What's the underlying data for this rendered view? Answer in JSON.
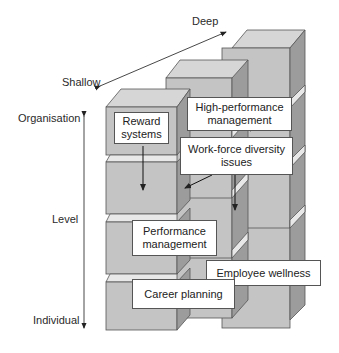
{
  "axes": {
    "depth": {
      "deep_label": "Deep",
      "shallow_label": "Shallow"
    },
    "level": {
      "top_label": "Organisation",
      "middle_label": "Level",
      "bottom_label": "Individual"
    }
  },
  "boxes": {
    "reward_systems": "Reward systems",
    "high_performance": "High-performance management",
    "workforce_diversity": "Work-force diversity issues",
    "performance_management": "Performance management",
    "employee_wellness": "Employee wellness",
    "career_planning": "Career planning"
  },
  "colors": {
    "front": "#c4c4c4",
    "top": "#d6d6d6",
    "side": "#9c9c9c",
    "stroke": "#555555"
  }
}
